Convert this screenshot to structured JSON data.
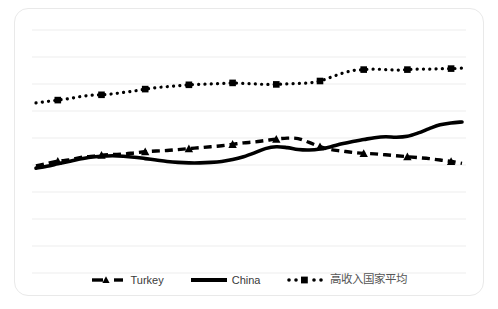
{
  "chart_data": {
    "type": "line",
    "title": "",
    "subtitle": "",
    "xlabel": "",
    "ylabel": "",
    "grid": true,
    "gridlines_y": [
      30,
      57,
      84,
      111,
      138,
      165,
      192,
      219,
      246,
      273
    ],
    "xlim": [
      0,
      39
    ],
    "ylim": [
      0,
      100
    ],
    "legend_position": "bottom",
    "x": [
      0,
      1,
      2,
      3,
      4,
      5,
      6,
      7,
      8,
      9,
      10,
      11,
      12,
      13,
      14,
      15,
      16,
      17,
      18,
      19,
      20,
      21,
      22,
      23,
      24,
      25,
      26,
      27,
      28,
      29,
      30,
      31,
      32,
      33,
      34,
      35,
      36,
      37,
      38,
      39
    ],
    "series": [
      {
        "name": "Turkey",
        "style": "dashed",
        "marker": "triangle",
        "color": "#000000",
        "values": [
          39.5,
          40.5,
          41.5,
          42.0,
          43.0,
          43.5,
          44.0,
          44.3,
          44.5,
          45.0,
          45.5,
          45.8,
          46.0,
          46.4,
          46.8,
          47.2,
          47.6,
          48.0,
          48.6,
          49.2,
          49.6,
          50.2,
          50.8,
          51.2,
          51.0,
          49.4,
          47.6,
          46.4,
          45.8,
          45.2,
          44.8,
          44.6,
          44.2,
          43.8,
          43.4,
          43.0,
          42.6,
          42.0,
          41.4,
          40.6
        ]
      },
      {
        "name": "China",
        "style": "solid",
        "marker": "none",
        "color": "#000000",
        "values": [
          38.6,
          39.4,
          40.4,
          41.4,
          42.4,
          43.2,
          43.6,
          43.8,
          43.6,
          43.2,
          42.6,
          42.0,
          41.4,
          41.0,
          40.8,
          40.8,
          41.0,
          41.4,
          42.2,
          43.4,
          45.0,
          46.8,
          47.6,
          47.2,
          46.4,
          46.2,
          46.6,
          47.6,
          48.8,
          49.8,
          50.6,
          51.4,
          51.8,
          51.6,
          52.0,
          53.4,
          55.2,
          56.8,
          57.6,
          58.0
        ]
      },
      {
        "name": "高收入国家平均",
        "style": "dotted",
        "marker": "square",
        "color": "#000000",
        "values": [
          66.0,
          66.6,
          67.2,
          67.8,
          68.6,
          69.2,
          69.4,
          69.8,
          70.4,
          71.0,
          71.8,
          72.4,
          72.8,
          73.2,
          73.6,
          73.8,
          74.0,
          74.2,
          74.4,
          74.2,
          74.0,
          73.8,
          73.8,
          74.0,
          74.2,
          74.4,
          75.2,
          76.8,
          78.4,
          79.6,
          80.0,
          80.2,
          80.0,
          79.8,
          80.0,
          80.2,
          80.2,
          80.4,
          80.4,
          80.6
        ]
      }
    ]
  },
  "legend": {
    "entries": [
      {
        "label": "Turkey",
        "swatch": "dashed-triangle-swatch"
      },
      {
        "label": "China",
        "swatch": "solid-line-swatch"
      },
      {
        "label": "高收入国家平均",
        "swatch": "dotted-square-swatch"
      }
    ]
  },
  "colors": {
    "series": "#000000",
    "gridline": "#ededed",
    "frame": "#e9e9e9",
    "background": "#ffffff",
    "legend_text": "#3a3a3a"
  }
}
